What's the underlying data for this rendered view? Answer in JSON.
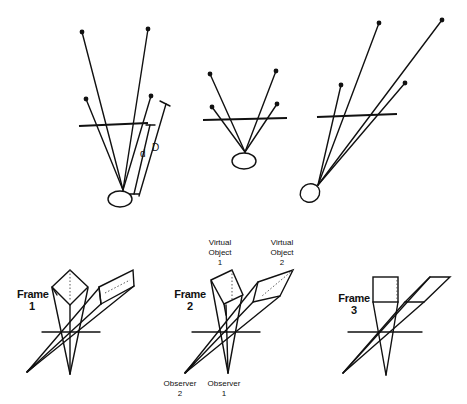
{
  "top_row": {
    "panel1": {
      "labels": {
        "small": "d",
        "large": "D"
      }
    },
    "panel2": {},
    "panel3": {}
  },
  "bottom_row": {
    "frames": [
      {
        "title": "Frame",
        "number": "1"
      },
      {
        "title": "Frame",
        "number": "2"
      },
      {
        "title": "Frame",
        "number": "3"
      }
    ],
    "virtual_objects": [
      {
        "line1": "Virtual",
        "line2": "Object",
        "number": "1"
      },
      {
        "line1": "Virtual",
        "line2": "Object",
        "number": "2"
      }
    ],
    "observers": [
      {
        "line1": "Observer",
        "number": "2"
      },
      {
        "line1": "Observer",
        "number": "1"
      }
    ]
  }
}
